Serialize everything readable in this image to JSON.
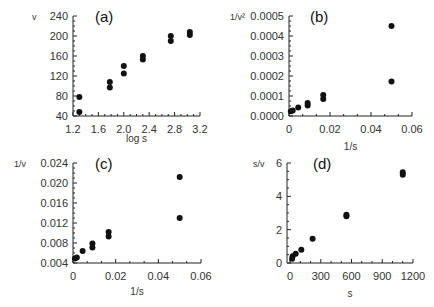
{
  "chart_data": [
    {
      "type": "scatter",
      "panel_label": "(a)",
      "xlabel": "log s",
      "ylabel": "v",
      "xlim": [
        1.2,
        3.2
      ],
      "ylim": [
        40,
        240
      ],
      "xticks": [
        "1.2",
        "1.6",
        "2.0",
        "2.4",
        "2.8",
        "3.2"
      ],
      "yticks": [
        "40",
        "80",
        "120",
        "160",
        "200",
        "240"
      ],
      "points": [
        [
          1.3,
          78
        ],
        [
          1.3,
          48
        ],
        [
          1.78,
          108
        ],
        [
          1.78,
          97
        ],
        [
          2.0,
          140
        ],
        [
          2.0,
          125
        ],
        [
          2.3,
          160
        ],
        [
          2.3,
          153
        ],
        [
          2.74,
          200
        ],
        [
          2.74,
          190
        ],
        [
          3.04,
          208
        ],
        [
          3.04,
          202
        ]
      ]
    },
    {
      "type": "scatter",
      "panel_label": "(b)",
      "xlabel": "1/s",
      "ylabel": "1/v²",
      "xlim": [
        0,
        0.06
      ],
      "ylim": [
        0,
        0.0005
      ],
      "xticks": [
        "0",
        "0.02",
        "0.04",
        "0.06"
      ],
      "yticks": [
        "0.0000",
        "0.0001",
        "0.0002",
        "0.0003",
        "0.0004",
        "0.0005"
      ],
      "points": [
        [
          0.0009,
          2.4e-05
        ],
        [
          0.0018,
          2.7e-05
        ],
        [
          0.0045,
          4.2e-05
        ],
        [
          0.0091,
          5.2e-05
        ],
        [
          0.0091,
          6.5e-05
        ],
        [
          0.0167,
          8.5e-05
        ],
        [
          0.0167,
          0.000105
        ],
        [
          0.05,
          0.000172
        ],
        [
          0.05,
          0.00045
        ]
      ]
    },
    {
      "type": "scatter",
      "panel_label": "(c)",
      "xlabel": "1/s",
      "ylabel": "1/v",
      "xlim": [
        0,
        0.06
      ],
      "ylim": [
        0.004,
        0.024
      ],
      "xticks": [
        "0",
        "0.02",
        "0.04",
        "0.06"
      ],
      "yticks": [
        "0.004",
        "0.008",
        "0.012",
        "0.016",
        "0.020",
        "0.024"
      ],
      "points": [
        [
          0.0009,
          0.0049
        ],
        [
          0.0018,
          0.0051
        ],
        [
          0.0045,
          0.0064
        ],
        [
          0.0091,
          0.0071
        ],
        [
          0.0091,
          0.0079
        ],
        [
          0.0167,
          0.0093
        ],
        [
          0.0167,
          0.0102
        ],
        [
          0.05,
          0.013
        ],
        [
          0.05,
          0.0212
        ]
      ]
    },
    {
      "type": "scatter",
      "panel_label": "(d)",
      "xlabel": "s",
      "ylabel": "s/v",
      "xlim": [
        -30,
        1200
      ],
      "ylim": [
        0,
        6
      ],
      "xticks": [
        "0",
        "300",
        "600",
        "900",
        "1200"
      ],
      "yticks": [
        "0",
        "2",
        "4",
        "6"
      ],
      "points": [
        [
          20,
          0.25
        ],
        [
          25,
          0.4
        ],
        [
          55,
          0.55
        ],
        [
          110,
          0.8
        ],
        [
          220,
          1.45
        ],
        [
          550,
          2.8
        ],
        [
          550,
          2.9
        ],
        [
          1100,
          5.3
        ],
        [
          1100,
          5.45
        ]
      ]
    }
  ]
}
